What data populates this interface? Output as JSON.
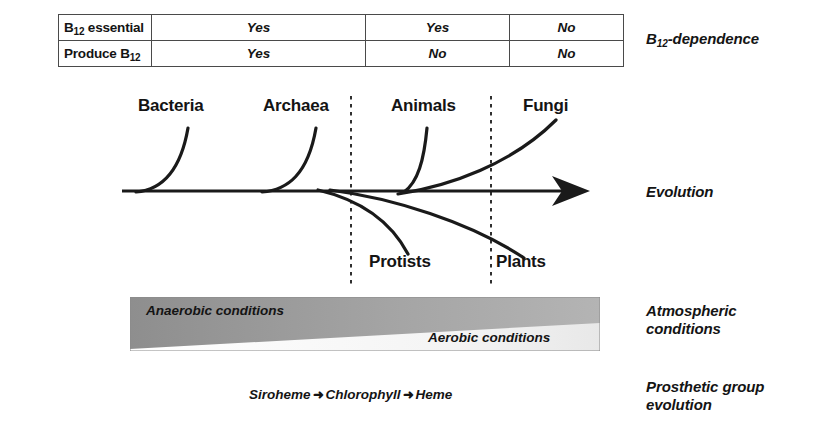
{
  "table": {
    "rows": [
      {
        "header": "B",
        "header_sub": "12",
        "header_rest": " essential",
        "cells": [
          "Yes",
          "Yes",
          "No"
        ]
      },
      {
        "header": "Produce B",
        "header_sub": "12",
        "header_rest": "",
        "cells": [
          "Yes",
          "No",
          "No"
        ]
      }
    ]
  },
  "side_labels": {
    "b12_dependence_pre": "B",
    "b12_dependence_sub": "12",
    "b12_dependence_post": "-dependence",
    "evolution": "Evolution",
    "atmospheric_line1": "Atmospheric",
    "atmospheric_line2": "conditions",
    "prosthetic_line1": "Prosthetic group",
    "prosthetic_line2": "evolution"
  },
  "evolution": {
    "taxa_upper": [
      "Bacteria",
      "Archaea",
      "Animals",
      "Fungi"
    ],
    "taxa_lower": [
      "Protists",
      "Plants"
    ],
    "axis_label": "Evolution"
  },
  "atmosphere": {
    "anaerobic": "Anaerobic conditions",
    "aerobic": "Aerobic conditions",
    "dark_color": "#9a9a9a",
    "light_color": "#fdfdfd"
  },
  "prosthetic": {
    "items": [
      "Siroheme",
      "Chlorophyll",
      "Heme"
    ],
    "arrow": "➜"
  }
}
